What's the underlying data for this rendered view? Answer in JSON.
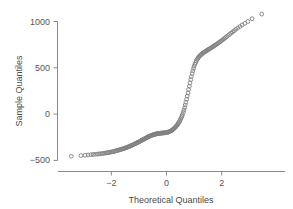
{
  "chart_data": {
    "type": "scatter",
    "title": "",
    "subtitle": "",
    "xlabel": "Theoretical Quantiles",
    "ylabel": "Sample Quantiles",
    "xlim": [
      -3.85,
      3.85
    ],
    "ylim": [
      -620,
      1180
    ],
    "xticks": [
      -2,
      0,
      2
    ],
    "xtick_labels": [
      "−2",
      "0",
      "2"
    ],
    "yticks": [
      -500,
      0,
      500,
      1000
    ],
    "ytick_labels": [
      "−500",
      "0",
      "500",
      "1000"
    ],
    "grid": false,
    "legend": null,
    "marker": "open-circle",
    "marker_color": "#808080",
    "series": [
      {
        "name": "sample quantiles",
        "x": [
          -3.45,
          -3.1,
          -2.95,
          -2.84,
          -2.74,
          -2.66,
          -2.58,
          -2.51,
          -2.45,
          -2.39,
          -2.33,
          -2.28,
          -2.23,
          -2.18,
          -2.13,
          -2.09,
          -2.05,
          -2.0,
          -1.96,
          -1.92,
          -1.88,
          -1.85,
          -1.81,
          -1.77,
          -1.74,
          -1.7,
          -1.67,
          -1.64,
          -1.6,
          -1.57,
          -1.54,
          -1.51,
          -1.48,
          -1.45,
          -1.42,
          -1.39,
          -1.36,
          -1.33,
          -1.3,
          -1.27,
          -1.25,
          -1.22,
          -1.19,
          -1.16,
          -1.14,
          -1.11,
          -1.08,
          -1.06,
          -1.03,
          -1.0,
          -0.98,
          -0.95,
          -0.93,
          -0.9,
          -0.88,
          -0.85,
          -0.83,
          -0.8,
          -0.78,
          -0.75,
          -0.73,
          -0.7,
          -0.68,
          -0.66,
          -0.63,
          -0.61,
          -0.58,
          -0.56,
          -0.54,
          -0.51,
          -0.49,
          -0.47,
          -0.44,
          -0.42,
          -0.4,
          -0.37,
          -0.35,
          -0.33,
          -0.3,
          -0.28,
          -0.26,
          -0.23,
          -0.21,
          -0.19,
          -0.17,
          -0.14,
          -0.12,
          -0.1,
          -0.07,
          -0.05,
          -0.03,
          0.0,
          0.03,
          0.05,
          0.07,
          0.1,
          0.12,
          0.14,
          0.17,
          0.19,
          0.21,
          0.23,
          0.26,
          0.28,
          0.3,
          0.33,
          0.35,
          0.37,
          0.4,
          0.42,
          0.44,
          0.47,
          0.49,
          0.51,
          0.54,
          0.56,
          0.58,
          0.61,
          0.63,
          0.66,
          0.68,
          0.7,
          0.73,
          0.75,
          0.78,
          0.8,
          0.83,
          0.85,
          0.88,
          0.9,
          0.93,
          0.95,
          0.98,
          1.0,
          1.03,
          1.06,
          1.08,
          1.11,
          1.14,
          1.16,
          1.19,
          1.22,
          1.25,
          1.27,
          1.3,
          1.33,
          1.36,
          1.39,
          1.42,
          1.45,
          1.48,
          1.51,
          1.54,
          1.57,
          1.6,
          1.64,
          1.67,
          1.7,
          1.74,
          1.77,
          1.81,
          1.85,
          1.88,
          1.92,
          1.96,
          2.0,
          2.05,
          2.09,
          2.13,
          2.18,
          2.23,
          2.28,
          2.33,
          2.39,
          2.45,
          2.51,
          2.58,
          2.66,
          2.74,
          2.84,
          2.95,
          3.1,
          3.45
        ],
        "y": [
          -455,
          -448,
          -444,
          -441,
          -438,
          -436,
          -434,
          -432,
          -430,
          -428,
          -426,
          -424,
          -421,
          -419,
          -417,
          -414,
          -412,
          -409,
          -406,
          -404,
          -401,
          -398,
          -395,
          -392,
          -389,
          -386,
          -383,
          -380,
          -377,
          -374,
          -371,
          -368,
          -364,
          -361,
          -358,
          -354,
          -351,
          -347,
          -344,
          -340,
          -336,
          -332,
          -328,
          -324,
          -320,
          -316,
          -312,
          -308,
          -304,
          -300,
          -296,
          -292,
          -288,
          -284,
          -280,
          -276,
          -272,
          -268,
          -264,
          -260,
          -256,
          -252,
          -248,
          -244,
          -241,
          -238,
          -235,
          -232,
          -229,
          -226,
          -224,
          -222,
          -220,
          -218,
          -216,
          -214,
          -212,
          -211,
          -210,
          -209,
          -208,
          -207,
          -206,
          -205,
          -205,
          -204,
          -204,
          -203,
          -202,
          -201,
          -200,
          -199,
          -197,
          -195,
          -193,
          -190,
          -187,
          -184,
          -180,
          -176,
          -171,
          -166,
          -160,
          -154,
          -147,
          -140,
          -132,
          -123,
          -114,
          -104,
          -93,
          -81,
          -68,
          -54,
          -38,
          -21,
          -2,
          20,
          44,
          70,
          98,
          128,
          160,
          194,
          229,
          265,
          301,
          337,
          372,
          405,
          437,
          466,
          493,
          517,
          539,
          558,
          575,
          590,
          603,
          614,
          624,
          633,
          641,
          648,
          655,
          661,
          667,
          673,
          679,
          684,
          690,
          696,
          701,
          707,
          713,
          719,
          726,
          732,
          739,
          746,
          753,
          761,
          769,
          777,
          786,
          795,
          805,
          815,
          825,
          836,
          848,
          860,
          873,
          886,
          900,
          915,
          930,
          946,
          963,
          980,
          1000,
          1030,
          1080
        ]
      }
    ]
  },
  "axes": {
    "x_title": "Theoretical Quantiles",
    "y_title": "Sample Quantiles",
    "x_tick_labels": [
      "−2",
      "0",
      "2"
    ],
    "y_tick_labels": [
      "1000",
      "500",
      "0",
      "−500"
    ]
  }
}
